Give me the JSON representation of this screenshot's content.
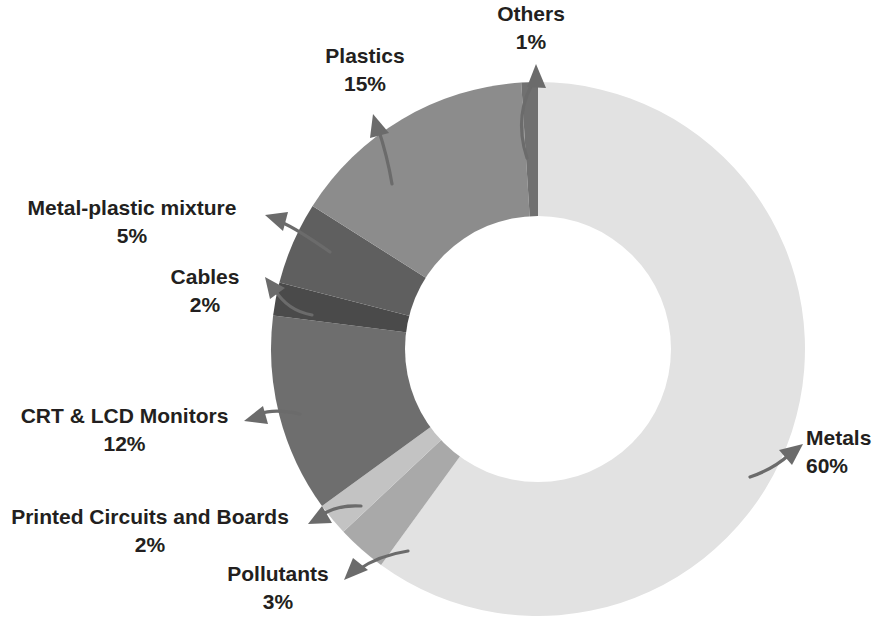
{
  "chart_data": {
    "type": "pie",
    "variant": "doughnut",
    "title": "",
    "subtitle": "",
    "xlabel": "",
    "ylabel": "",
    "legend_position": "none",
    "grid": false,
    "units": "percent",
    "total": 100,
    "hole_ratio": 0.5,
    "start_angle_deg": 0,
    "direction": "clockwise",
    "categories": [
      "Metals",
      "Pollutants",
      "Printed Circuits and Boards",
      "CRT & LCD Monitors",
      "Cables",
      "Metal-plastic mixture",
      "Plastics",
      "Others"
    ],
    "values": [
      60,
      3,
      2,
      12,
      2,
      5,
      15,
      1
    ],
    "colors": [
      "#e2e2e2",
      "#a9a9a9",
      "#c3c3c3",
      "#6e6e6e",
      "#4a4a4a",
      "#5f5f5f",
      "#8c8c8c",
      "#707070"
    ],
    "slices": [
      {
        "label": "Metals",
        "value": 60,
        "value_text": "60%",
        "color": "#e2e2e2"
      },
      {
        "label": "Pollutants",
        "value": 3,
        "value_text": "3%",
        "color": "#a9a9a9"
      },
      {
        "label": "Printed Circuits and Boards",
        "value": 2,
        "value_text": "2%",
        "color": "#c3c3c3"
      },
      {
        "label": "CRT & LCD Monitors",
        "value": 12,
        "value_text": "12%",
        "color": "#6e6e6e"
      },
      {
        "label": "Cables",
        "value": 2,
        "value_text": "2%",
        "color": "#4a4a4a"
      },
      {
        "label": "Metal-plastic mixture",
        "value": 5,
        "value_text": "5%",
        "color": "#5f5f5f"
      },
      {
        "label": "Plastics",
        "value": 15,
        "value_text": "15%",
        "color": "#8c8c8c"
      },
      {
        "label": "Others",
        "value": 1,
        "value_text": "1%",
        "color": "#707070"
      }
    ]
  },
  "callouts": {
    "others": {
      "category": "Others",
      "value_text": "1%"
    },
    "plastics": {
      "category": "Plastics",
      "value_text": "15%"
    },
    "metal_plastic": {
      "category": "Metal-plastic mixture",
      "value_text": "5%"
    },
    "cables": {
      "category": "Cables",
      "value_text": "2%"
    },
    "monitors": {
      "category": "CRT & LCD Monitors",
      "value_text": "12%"
    },
    "pcb": {
      "category": "Printed Circuits and Boards",
      "value_text": "2%"
    },
    "pollutants": {
      "category": "Pollutants",
      "value_text": "3%"
    },
    "metals": {
      "category": "Metals",
      "value_text": "60%"
    }
  },
  "style": {
    "background": "#ffffff",
    "label_color": "#231f20",
    "leader_color": "#6b6b6b"
  }
}
